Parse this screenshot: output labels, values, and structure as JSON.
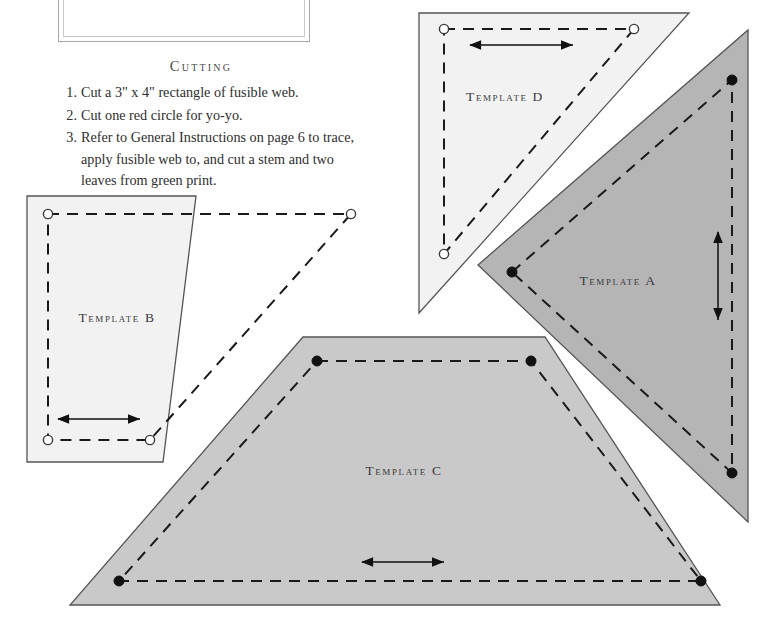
{
  "page": {
    "background_color": "#ffffff",
    "width": 771,
    "height": 637
  },
  "frame_box": {
    "name": "cut-off decorative frame",
    "border_color": "#a8a8a8",
    "inner_border_color": "#c9c9c9",
    "fill": "#ffffff"
  },
  "cutting": {
    "heading": "Cutting",
    "steps": [
      "Cut a 3\" x 4\" rectangle of fusible web.",
      "Cut one red circle for yo-yo.",
      "Refer to General Instructions on page 6 to trace, apply fusible web to, and cut a stem and two leaves from green print."
    ]
  },
  "colors": {
    "template_light_fill": "#f2f2f2",
    "template_mid_fill": "#c9c9c9",
    "template_dark_fill": "#b5b5b5",
    "outline": "#555555",
    "dash_line": "#1a1a1a",
    "arrow": "#111111",
    "open_marker_fill": "#ffffff",
    "closed_marker_fill": "#111111"
  },
  "templates": [
    {
      "id": "a",
      "label": "Template A",
      "shape": "right-triangle",
      "fill": "#b5b5b5",
      "marker_style": "filled-dot",
      "grainline_arrow": "vertical",
      "label_x": 618,
      "label_y": 285,
      "outline_points": "478,265 748,30 748,522",
      "seam_points": "512,272 732,80 732,473",
      "markers": [
        {
          "x": 512,
          "y": 272,
          "filled": true
        },
        {
          "x": 732,
          "y": 80,
          "filled": true
        },
        {
          "x": 732,
          "y": 473,
          "filled": true
        }
      ],
      "arrow": {
        "x1": 718,
        "y1": 232,
        "x2": 718,
        "y2": 320,
        "orientation": "vertical"
      }
    },
    {
      "id": "b",
      "label": "Template B",
      "shape": "trapezoid",
      "fill": "#f2f2f2",
      "marker_style": "open-circle",
      "grainline_arrow": "horizontal",
      "label_x": 117,
      "label_y": 322,
      "outline_points": "27,196 196,196 163,462 27,462",
      "seam_points": "48,214 351,214 150,440 48,440",
      "markers": [
        {
          "x": 48,
          "y": 214,
          "filled": false
        },
        {
          "x": 351,
          "y": 214,
          "filled": false
        },
        {
          "x": 150,
          "y": 440,
          "filled": false
        },
        {
          "x": 48,
          "y": 440,
          "filled": false
        }
      ],
      "arrow": {
        "x1": 58,
        "y1": 419,
        "x2": 140,
        "y2": 419,
        "orientation": "horizontal"
      }
    },
    {
      "id": "c",
      "label": "Template C",
      "shape": "trapezoid",
      "fill": "#c9c9c9",
      "marker_style": "filled-dot",
      "grainline_arrow": "horizontal",
      "label_x": 404,
      "label_y": 475,
      "outline_points": "303,337 545,337 720,605 70,605",
      "seam_points": "317,361 531,361 701,581 119,581",
      "markers": [
        {
          "x": 317,
          "y": 361,
          "filled": true
        },
        {
          "x": 531,
          "y": 361,
          "filled": true
        },
        {
          "x": 701,
          "y": 581,
          "filled": true
        },
        {
          "x": 119,
          "y": 581,
          "filled": true
        }
      ],
      "arrow": {
        "x1": 362,
        "y1": 562,
        "x2": 444,
        "y2": 562,
        "orientation": "horizontal"
      }
    },
    {
      "id": "d",
      "label": "Template D",
      "shape": "right-triangle",
      "fill": "#f2f2f2",
      "marker_style": "open-circle",
      "grainline_arrow": "horizontal",
      "label_x": 505,
      "label_y": 101,
      "outline_points": "419,13 689,13 419,313",
      "seam_points": "444,29 634,29 444,254",
      "markers": [
        {
          "x": 444,
          "y": 29,
          "filled": false
        },
        {
          "x": 634,
          "y": 29,
          "filled": false
        },
        {
          "x": 444,
          "y": 254,
          "filled": false
        }
      ],
      "arrow": {
        "x1": 470,
        "y1": 45,
        "x2": 573,
        "y2": 45,
        "orientation": "horizontal"
      }
    }
  ]
}
